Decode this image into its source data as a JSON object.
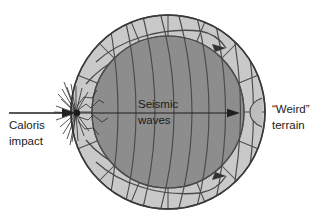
{
  "figure": {
    "type": "cross-section-diagram",
    "background_color": "#ffffff"
  },
  "colors": {
    "mantle_band": "#c9c9c9",
    "core": "#8d8d8d",
    "line": "#444444",
    "outline": "#3a3a3a",
    "text": "#1a1a1a",
    "weird_terrain_fill": "#bdbdbd"
  },
  "geometry": {
    "center_x": 168,
    "center_y": 112,
    "outer_radius": 97,
    "core_radius": 76
  },
  "labels": {
    "impact_line1": "Caloris",
    "impact_line2": "impact",
    "seismic_line1": "Seismic",
    "seismic_line2": "waves",
    "terrain_line1": "“Weird”",
    "terrain_line2": "terrain"
  },
  "elements": {
    "incoming_arrow": "impact-arrow",
    "axis_arrow": "seismic-wave-axis-arrow",
    "starburst": "impact-starburst",
    "surface_arrow_upper": "surface-wave-arrow-upper-right",
    "surface_arrow_lower": "surface-wave-arrow-lower-right",
    "antipode_bulge": "weird-terrain-bulge",
    "wavefronts_count": 9,
    "radial_lines_count": 16
  }
}
